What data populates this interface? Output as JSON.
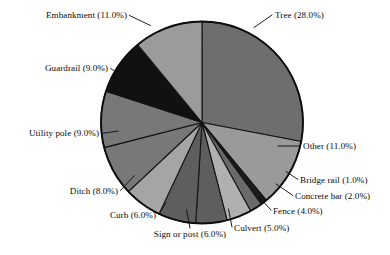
{
  "chart_data": {
    "type": "pie",
    "title": "",
    "subtitle": "",
    "xlabel": "",
    "ylabel": "",
    "legend_position": "none",
    "grid": false,
    "label_format": "{name} ({value}%)",
    "start_angle_deg": 0,
    "direction": "clockwise",
    "units": "percent",
    "total": 100.0,
    "categories": [
      "Tree",
      "Other",
      "Bridge rail",
      "Concrete bar",
      "Fence",
      "Culvert",
      "Sign or post",
      "Curb",
      "Ditch",
      "Utility pole",
      "Guardrail",
      "Embankment"
    ],
    "values": [
      28.0,
      11.0,
      1.0,
      2.0,
      4.0,
      5.0,
      6.0,
      6.0,
      8.0,
      9.0,
      9.0,
      11.0
    ],
    "colors": [
      "#6e6e6e",
      "#9a9a9a",
      "#1a1a1a",
      "#6a6a6a",
      "#b0b0b0",
      "#5e5e5e",
      "#5e5e5e",
      "#a5a5a5",
      "#787878",
      "#787878",
      "#111111",
      "#9b9b9b"
    ],
    "slices": [
      {
        "name": "Tree",
        "value": 28.0,
        "label": "Tree (28.0%)",
        "color": "#6e6e6e"
      },
      {
        "name": "Other",
        "value": 11.0,
        "label": "Other (11.0%)",
        "color": "#9a9a9a"
      },
      {
        "name": "Bridge rail",
        "value": 1.0,
        "label": "Bridge rail (1.0%)",
        "color": "#1a1a1a"
      },
      {
        "name": "Concrete bar",
        "value": 2.0,
        "label": "Concrete bar (2.0%)",
        "color": "#6a6a6a"
      },
      {
        "name": "Fence",
        "value": 4.0,
        "label": "Fence (4.0%)",
        "color": "#b0b0b0"
      },
      {
        "name": "Culvert",
        "value": 5.0,
        "label": "Culvert (5.0%)",
        "color": "#5e5e5e"
      },
      {
        "name": "Sign or post",
        "value": 6.0,
        "label": "Sign or post (6.0%)",
        "color": "#5e5e5e"
      },
      {
        "name": "Curb",
        "value": 6.0,
        "label": "Curb (6.0%)",
        "color": "#a5a5a5"
      },
      {
        "name": "Ditch",
        "value": 8.0,
        "label": "Ditch (8.0%)",
        "color": "#787878"
      },
      {
        "name": "Utility pole",
        "value": 9.0,
        "label": "Utility pole (9.0%)",
        "color": "#787878"
      },
      {
        "name": "Guardrail",
        "value": 9.0,
        "label": "Guardrail (9.0%)",
        "color": "#111111"
      },
      {
        "name": "Embankment",
        "value": 11.0,
        "label": "Embankment (11.0%)",
        "color": "#9b9b9b"
      }
    ]
  },
  "labels": {
    "tree": "Tree (28.0%)",
    "other": "Other (11.0%)",
    "bridge_rail": "Bridge rail (1.0%)",
    "concrete_bar": "Concrete bar (2.0%)",
    "fence": "Fence (4.0%)",
    "culvert": "Culvert (5.0%)",
    "sign_or_post": "Sign or post (6.0%)",
    "curb": "Curb (6.0%)",
    "ditch": "Ditch (8.0%)",
    "utility_pole": "Utility pole (9.0%)",
    "guardrail": "Guardrail (9.0%)",
    "embankment": "Embankment (11.0%)"
  }
}
